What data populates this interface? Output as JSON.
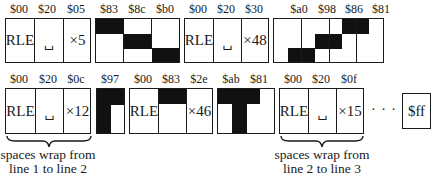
{
  "row1": {
    "rle1": {
      "bytes": [
        "$00",
        "$20",
        "$05"
      ],
      "cells": [
        "RLE",
        "␣",
        "×5"
      ]
    },
    "bitmap1": {
      "bytes": [
        "$83",
        "$8c",
        "$b0"
      ]
    },
    "rle2": {
      "bytes": [
        "$00",
        "$20",
        "$30"
      ],
      "cells": [
        "RLE",
        "␣",
        "×48"
      ]
    },
    "bitmap2": {
      "bytes": [
        "$a0",
        "$98",
        "$86",
        "$81"
      ]
    }
  },
  "row2": {
    "rle3": {
      "bytes": [
        "$00",
        "$20",
        "$0c"
      ],
      "cells": [
        "RLE",
        "␣",
        "×12"
      ]
    },
    "bitmap3": {
      "bytes": [
        "$97"
      ]
    },
    "rle4": {
      "bytes": [
        "$00",
        "$83",
        "$2e"
      ],
      "cells": [
        "RLE",
        "",
        "×46"
      ]
    },
    "bitmap4": {
      "bytes": [
        "$ab",
        "$81"
      ]
    },
    "rle5": {
      "bytes": [
        "$00",
        "$20",
        "$0f"
      ],
      "cells": [
        "RLE",
        "␣",
        "×15"
      ]
    },
    "ellipsis": "· · ·",
    "terminator": "$ff"
  },
  "captions": {
    "wrap1": [
      "spaces wrap from",
      "line 1 to line 2"
    ],
    "wrap2": [
      "spaces wrap from",
      "line 2 to line 3"
    ]
  }
}
